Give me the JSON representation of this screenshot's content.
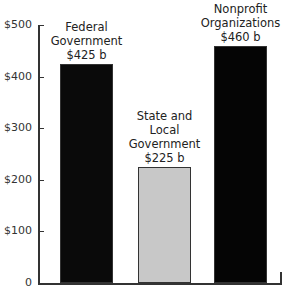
{
  "chart_data": {
    "type": "bar",
    "title": "",
    "xlabel": "",
    "ylabel": "",
    "ylim": [
      0,
      500
    ],
    "yticks": [
      0,
      100,
      200,
      300,
      400,
      500
    ],
    "ytick_labels": [
      "0",
      "$100",
      "$200",
      "$300",
      "$400",
      "$500"
    ],
    "categories": [
      "Federal Government",
      "State and Local Government",
      "Nonprofit Organizations"
    ],
    "values": [
      425,
      225,
      460
    ],
    "value_labels": [
      "$425 b",
      "$225 b",
      "$460 b"
    ],
    "label_lines": [
      [
        "Federal",
        "Government",
        "$425 b"
      ],
      [
        "State and",
        "Local",
        "Government",
        "$225 b"
      ],
      [
        "Nonprofit",
        "Organizations",
        "$460 b"
      ]
    ],
    "colors": [
      "#0a0a0a",
      "#c8c8c8",
      "#050505"
    ],
    "units": "billions of dollars",
    "grid": false,
    "legend": null
  }
}
